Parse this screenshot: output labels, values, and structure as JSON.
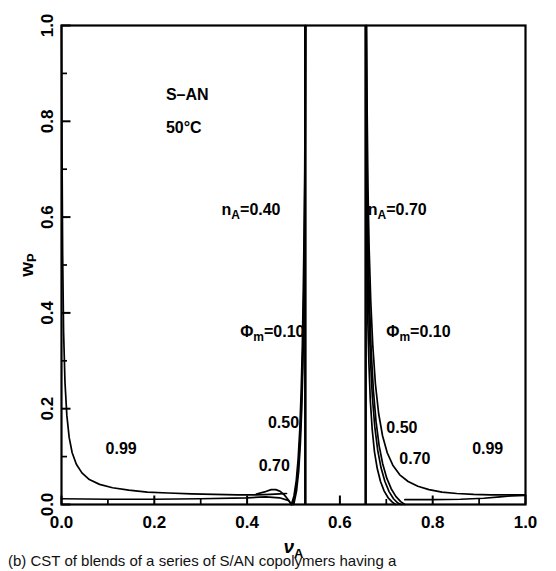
{
  "figure": {
    "system_label": "S–AN",
    "temperature_label": "50°C",
    "background_color": "#ffffff",
    "ink_color": "#000000"
  },
  "chart_data": {
    "type": "line",
    "title": "",
    "xlabel": "ν",
    "xlabel_sub": "A",
    "ylabel": "w",
    "ylabel_sub": "P",
    "xlim": [
      0.0,
      1.0
    ],
    "ylim": [
      0.0,
      1.0
    ],
    "grid": false,
    "legend_position": "none",
    "x_major_ticks": [
      0.0,
      0.2,
      0.4,
      0.6,
      0.8,
      1.0
    ],
    "x_major_tick_labels": [
      "0.0",
      "0.2",
      "0.4",
      "0.6",
      "0.8",
      "1.0"
    ],
    "x_minor_ticks": [
      0.1,
      0.3,
      0.5,
      0.7,
      0.9
    ],
    "y_major_ticks": [
      0.0,
      0.2,
      0.4,
      0.6,
      0.8,
      1.0
    ],
    "y_major_tick_labels": [
      "0.0",
      "0.2",
      "0.4",
      "0.6",
      "0.8",
      "1.0"
    ],
    "y_minor_ticks": [
      0.1,
      0.3,
      0.5,
      0.7,
      0.9
    ],
    "annotations": [
      {
        "text": "S–AN",
        "x": 0.225,
        "y": 0.845
      },
      {
        "text": "50°C",
        "x": 0.225,
        "y": 0.775
      },
      {
        "text": "n",
        "sub": "A",
        "rest": "=0.40",
        "x": 0.345,
        "y": 0.605
      },
      {
        "text": "n",
        "sub": "A",
        "rest": "=0.70",
        "x": 0.66,
        "y": 0.605
      },
      {
        "text": "Φ",
        "sub": "m",
        "rest": "=0.10",
        "x": 0.385,
        "y": 0.35
      },
      {
        "text": "Φ",
        "sub": "m",
        "rest": "=0.10",
        "x": 0.7,
        "y": 0.35
      }
    ],
    "curve_labels": [
      {
        "text": "0.99",
        "x": 0.095,
        "y": 0.105
      },
      {
        "text": "0.50",
        "x": 0.445,
        "y": 0.16
      },
      {
        "text": "0.70",
        "x": 0.425,
        "y": 0.07
      },
      {
        "text": "0.50",
        "x": 0.7,
        "y": 0.15
      },
      {
        "text": "0.70",
        "x": 0.728,
        "y": 0.085
      },
      {
        "text": "0.99",
        "x": 0.885,
        "y": 0.105
      }
    ],
    "asymptotes": [
      {
        "name": "n_A=0.40 upper boundary",
        "x": 0.5255
      },
      {
        "name": "n_A=0.70 lower boundary",
        "x": 0.6555
      }
    ],
    "series": [
      {
        "name": "Φm=0.99 left branch",
        "phi_m": 0.99,
        "branch": "left",
        "points": [
          [
            0.0,
            1.0
          ],
          [
            0.001,
            0.76
          ],
          [
            0.0025,
            0.52
          ],
          [
            0.0045,
            0.36
          ],
          [
            0.0075,
            0.255
          ],
          [
            0.0115,
            0.186
          ],
          [
            0.0165,
            0.14
          ],
          [
            0.023,
            0.108
          ],
          [
            0.032,
            0.084
          ],
          [
            0.044,
            0.066
          ],
          [
            0.06,
            0.052
          ],
          [
            0.082,
            0.042
          ],
          [
            0.11,
            0.035
          ],
          [
            0.145,
            0.03
          ],
          [
            0.185,
            0.026
          ],
          [
            0.23,
            0.024
          ],
          [
            0.28,
            0.022
          ],
          [
            0.33,
            0.021
          ],
          [
            0.38,
            0.02
          ],
          [
            0.42,
            0.02
          ],
          [
            0.45,
            0.021
          ],
          [
            0.47,
            0.022
          ],
          [
            0.485,
            0.023
          ]
        ]
      },
      {
        "name": "Φm=0.70 left lobe",
        "phi_m": 0.7,
        "branch": "left",
        "points": [
          [
            0.42,
            0.022
          ],
          [
            0.44,
            0.027
          ],
          [
            0.452,
            0.031
          ],
          [
            0.462,
            0.031
          ],
          [
            0.472,
            0.027
          ],
          [
            0.48,
            0.02
          ],
          [
            0.487,
            0.012
          ],
          [
            0.492,
            0.005
          ],
          [
            0.4955,
            0.0
          ]
        ]
      },
      {
        "name": "Φm=0.70 left rise",
        "phi_m": 0.7,
        "branch": "left-rise",
        "points": [
          [
            0.4955,
            0.0
          ],
          [
            0.501,
            0.018
          ],
          [
            0.506,
            0.05
          ],
          [
            0.51,
            0.095
          ],
          [
            0.5135,
            0.155
          ],
          [
            0.5165,
            0.235
          ],
          [
            0.519,
            0.33
          ],
          [
            0.521,
            0.44
          ],
          [
            0.5228,
            0.565
          ],
          [
            0.5242,
            0.7
          ],
          [
            0.525,
            0.84
          ],
          [
            0.5255,
            1.0
          ]
        ]
      },
      {
        "name": "Φm=0.50 left rise",
        "phi_m": 0.5,
        "branch": "left-rise",
        "points": [
          [
            0.4975,
            0.0
          ],
          [
            0.5035,
            0.022
          ],
          [
            0.5085,
            0.058
          ],
          [
            0.5125,
            0.108
          ],
          [
            0.5158,
            0.175
          ],
          [
            0.5185,
            0.258
          ],
          [
            0.5208,
            0.355
          ],
          [
            0.5226,
            0.47
          ],
          [
            0.524,
            0.6
          ],
          [
            0.525,
            0.745
          ],
          [
            0.5255,
            0.88
          ],
          [
            0.5258,
            1.0
          ]
        ]
      },
      {
        "name": "Φm=0.10 left rise",
        "phi_m": 0.1,
        "branch": "left-rise",
        "points": [
          [
            0.5005,
            0.0
          ],
          [
            0.5065,
            0.028
          ],
          [
            0.5112,
            0.07
          ],
          [
            0.5148,
            0.128
          ],
          [
            0.5178,
            0.2
          ],
          [
            0.5202,
            0.288
          ],
          [
            0.5222,
            0.39
          ],
          [
            0.5238,
            0.51
          ],
          [
            0.5248,
            0.648
          ],
          [
            0.5255,
            0.8
          ],
          [
            0.5259,
            1.0
          ]
        ]
      },
      {
        "name": "Φm=0.10 right fall",
        "phi_m": 0.1,
        "branch": "right-fall",
        "points": [
          [
            0.6558,
            1.0
          ],
          [
            0.6562,
            0.8
          ],
          [
            0.657,
            0.64
          ],
          [
            0.6582,
            0.505
          ],
          [
            0.66,
            0.39
          ],
          [
            0.6625,
            0.295
          ],
          [
            0.6655,
            0.218
          ],
          [
            0.6695,
            0.158
          ],
          [
            0.6745,
            0.11
          ],
          [
            0.6805,
            0.075
          ],
          [
            0.6875,
            0.048
          ],
          [
            0.6955,
            0.028
          ],
          [
            0.704,
            0.014
          ],
          [
            0.713,
            0.005
          ],
          [
            0.72,
            0.0
          ]
        ]
      },
      {
        "name": "Φm=0.50 right fall",
        "phi_m": 0.5,
        "branch": "right-fall",
        "points": [
          [
            0.6562,
            1.0
          ],
          [
            0.657,
            0.805
          ],
          [
            0.6582,
            0.648
          ],
          [
            0.66,
            0.515
          ],
          [
            0.6625,
            0.4
          ],
          [
            0.6658,
            0.303
          ],
          [
            0.67,
            0.224
          ],
          [
            0.6752,
            0.162
          ],
          [
            0.6815,
            0.113
          ],
          [
            0.6888,
            0.076
          ],
          [
            0.697,
            0.048
          ],
          [
            0.706,
            0.027
          ],
          [
            0.7155,
            0.012
          ],
          [
            0.725,
            0.003
          ],
          [
            0.732,
            0.0
          ]
        ]
      },
      {
        "name": "Φm=0.70 right fall",
        "phi_m": 0.7,
        "branch": "right-fall",
        "points": [
          [
            0.6568,
            1.0
          ],
          [
            0.6578,
            0.812
          ],
          [
            0.6592,
            0.658
          ],
          [
            0.6612,
            0.528
          ],
          [
            0.664,
            0.415
          ],
          [
            0.6676,
            0.318
          ],
          [
            0.6722,
            0.238
          ],
          [
            0.6778,
            0.174
          ],
          [
            0.6845,
            0.123
          ],
          [
            0.6922,
            0.085
          ],
          [
            0.701,
            0.055
          ],
          [
            0.7105,
            0.033
          ],
          [
            0.7205,
            0.017
          ],
          [
            0.731,
            0.006
          ],
          [
            0.74,
            0.0
          ]
        ]
      },
      {
        "name": "Φm=0.99 right branch",
        "phi_m": 0.99,
        "branch": "right",
        "points": [
          [
            0.6575,
            1.0
          ],
          [
            0.6588,
            0.815
          ],
          [
            0.6605,
            0.662
          ],
          [
            0.663,
            0.535
          ],
          [
            0.6665,
            0.424
          ],
          [
            0.671,
            0.33
          ],
          [
            0.6765,
            0.252
          ],
          [
            0.6835,
            0.19
          ],
          [
            0.692,
            0.143
          ],
          [
            0.702,
            0.108
          ],
          [
            0.714,
            0.082
          ],
          [
            0.729,
            0.062
          ],
          [
            0.747,
            0.048
          ],
          [
            0.768,
            0.038
          ],
          [
            0.792,
            0.031
          ],
          [
            0.82,
            0.026
          ],
          [
            0.852,
            0.023
          ],
          [
            0.888,
            0.021
          ],
          [
            0.925,
            0.02
          ],
          [
            0.96,
            0.02
          ],
          [
            0.985,
            0.02
          ],
          [
            1.0,
            0.02
          ]
        ]
      },
      {
        "name": "Φm=0.70 left baseline tail",
        "phi_m": 0.7,
        "branch": "left-baseline",
        "points": [
          [
            0.0,
            0.012
          ],
          [
            0.1,
            0.011
          ],
          [
            0.2,
            0.011
          ],
          [
            0.3,
            0.012
          ],
          [
            0.4,
            0.014
          ],
          [
            0.44,
            0.016
          ],
          [
            0.47,
            0.014
          ],
          [
            0.49,
            0.008
          ],
          [
            0.4955,
            0.0
          ]
        ]
      },
      {
        "name": "Φm=0.99 right baseline tail",
        "phi_m": 0.99,
        "branch": "right-baseline",
        "points": [
          [
            0.74,
            0.01
          ],
          [
            0.8,
            0.01
          ],
          [
            0.86,
            0.011
          ],
          [
            0.91,
            0.013
          ],
          [
            0.945,
            0.016
          ],
          [
            0.97,
            0.018
          ],
          [
            1.0,
            0.019
          ]
        ]
      }
    ]
  },
  "caption": {
    "text": "(b) CST of blends of a series of S/AN copolymers having a"
  }
}
